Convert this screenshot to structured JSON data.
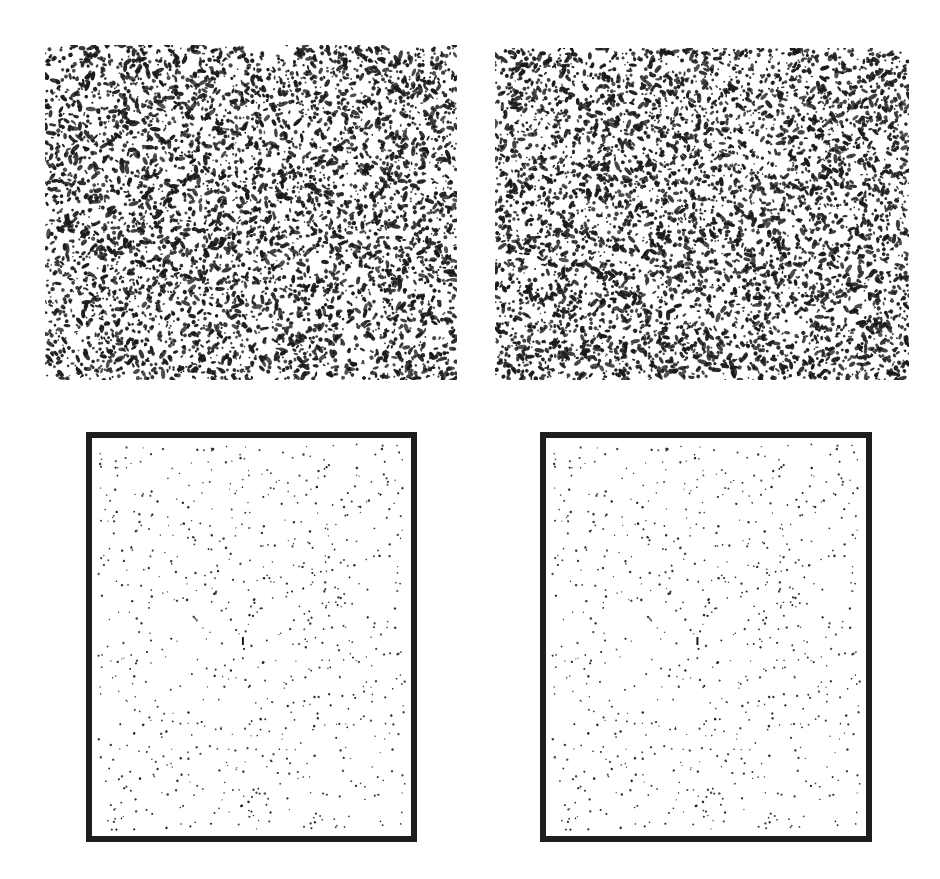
{
  "figure": {
    "background": "#ffffff",
    "dot_color": "#1a1a1a",
    "frame_color": "#1e1e1e",
    "panels": [
      {
        "id": "top-left",
        "label": "",
        "x": 45,
        "y": 45,
        "w": 412,
        "h": 335,
        "framed": false,
        "density": "dense",
        "seed": 11,
        "count": 5200,
        "size_min": 1.5,
        "size_max": 4.5
      },
      {
        "id": "top-right",
        "label": "",
        "x": 495,
        "y": 48,
        "w": 414,
        "h": 332,
        "framed": false,
        "density": "dense",
        "seed": 23,
        "count": 5200,
        "size_min": 1.5,
        "size_max": 4.5
      },
      {
        "id": "bottom-left",
        "label": "",
        "x": 86,
        "y": 432,
        "w": 331,
        "h": 410,
        "framed": true,
        "density": "sparse",
        "seed": 37,
        "count": 760,
        "size_min": 1.2,
        "size_max": 2.6
      },
      {
        "id": "bottom-right",
        "label": "",
        "x": 540,
        "y": 432,
        "w": 332,
        "h": 410,
        "framed": true,
        "density": "sparse",
        "seed": 37,
        "count": 760,
        "size_min": 1.2,
        "size_max": 2.6
      }
    ]
  }
}
